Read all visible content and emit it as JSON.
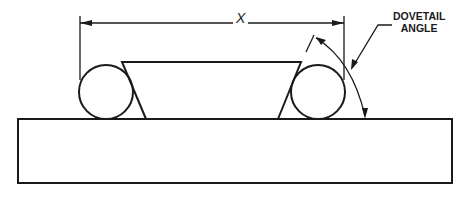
{
  "diagram": {
    "labels": {
      "dimension": "X",
      "angle_line1": "DOVETAIL",
      "angle_line2": "ANGLE"
    },
    "colors": {
      "stroke": "#1a1a1a",
      "background": "#ffffff"
    }
  }
}
